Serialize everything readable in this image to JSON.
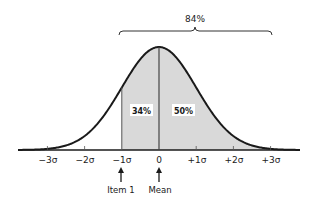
{
  "diagram": {
    "type": "normal-distribution-curve",
    "bracket_label": "84%",
    "regions": [
      {
        "name": "minus-1-to-mean",
        "label": "34%"
      },
      {
        "name": "mean-and-above",
        "label": "50%"
      }
    ],
    "axis_ticks": [
      "−3σ",
      "−2σ",
      "−1σ",
      "0",
      "+1σ",
      "+2σ",
      "+3σ"
    ],
    "markers": [
      {
        "at": "−1σ",
        "label": "Item 1"
      },
      {
        "at": "0",
        "label": "Mean"
      }
    ],
    "colors": {
      "curve": "#1a1a1a",
      "shade": "#d9d9d9",
      "background": "#ffffff"
    }
  }
}
